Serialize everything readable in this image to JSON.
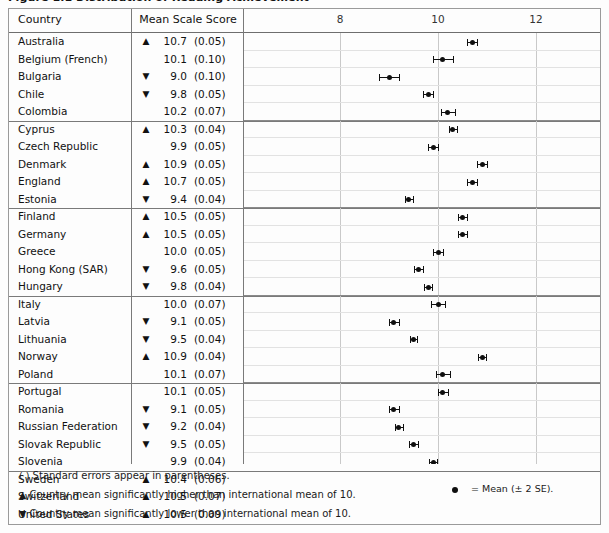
{
  "figure": {
    "clipped_title": "Figure 1.1 Distribution of Reading Achievement",
    "columns": {
      "country": "Country",
      "mean_scale_score": "Mean Scale Score"
    }
  },
  "axis": {
    "ticks": [
      8,
      10,
      12
    ],
    "tick_labels": [
      "8",
      "10",
      "12"
    ],
    "min": 6.4,
    "max": 13.6,
    "px_per_unit": 49.0,
    "origin_value": 8,
    "origin_px": 96
  },
  "footnotes": [
    {
      "symbol": "( )",
      "text": "Standard errors appear in parentheses."
    },
    {
      "symbol": "▲",
      "text": "Country mean significantly higher than international mean of 10."
    },
    {
      "symbol": "▼",
      "text": "Country mean significantly lower than international mean of 10."
    }
  ],
  "legend": {
    "marker": "dot",
    "text": "= Mean (± 2 SE)."
  },
  "chart_data": {
    "type": "scatter",
    "xlabel": "",
    "ylabel": "Country",
    "xlim": [
      6.4,
      13.6
    ],
    "xticks": [
      8,
      10,
      12
    ],
    "grid": true,
    "error_bars": "± 2 SE",
    "international_mean": 10,
    "categories": [
      "Australia",
      "Belgium (French)",
      "Bulgaria",
      "Chile",
      "Colombia",
      "Cyprus",
      "Czech Republic",
      "Denmark",
      "England",
      "Estonia",
      "Finland",
      "Germany",
      "Greece",
      "Hong Kong (SAR)",
      "Hungary",
      "Italy",
      "Latvia",
      "Lithuania",
      "Norway",
      "Poland",
      "Portugal",
      "Romania",
      "Russian Federation",
      "Slovak Republic",
      "Slovenia",
      "Sweden",
      "Switzerland",
      "United States"
    ],
    "rows": [
      {
        "country": "Australia",
        "marker": "▲",
        "mean": "10.7",
        "se": "(0.05)",
        "mean_value": 10.7,
        "se_value": 0.05,
        "group": 0
      },
      {
        "country": "Belgium (French)",
        "marker": "",
        "mean": "10.1",
        "se": "(0.10)",
        "mean_value": 10.1,
        "se_value": 0.1,
        "group": 0
      },
      {
        "country": "Bulgaria",
        "marker": "▼",
        "mean": "9.0",
        "se": "(0.10)",
        "mean_value": 9.0,
        "se_value": 0.1,
        "group": 0
      },
      {
        "country": "Chile",
        "marker": "▼",
        "mean": "9.8",
        "se": "(0.05)",
        "mean_value": 9.8,
        "se_value": 0.05,
        "group": 0
      },
      {
        "country": "Colombia",
        "marker": "",
        "mean": "10.2",
        "se": "(0.07)",
        "mean_value": 10.2,
        "se_value": 0.07,
        "group": 0
      },
      {
        "country": "Cyprus",
        "marker": "▲",
        "mean": "10.3",
        "se": "(0.04)",
        "mean_value": 10.3,
        "se_value": 0.04,
        "group": 1
      },
      {
        "country": "Czech Republic",
        "marker": "",
        "mean": "9.9",
        "se": "(0.05)",
        "mean_value": 9.9,
        "se_value": 0.05,
        "group": 1
      },
      {
        "country": "Denmark",
        "marker": "▲",
        "mean": "10.9",
        "se": "(0.05)",
        "mean_value": 10.9,
        "se_value": 0.05,
        "group": 1
      },
      {
        "country": "England",
        "marker": "▲",
        "mean": "10.7",
        "se": "(0.05)",
        "mean_value": 10.7,
        "se_value": 0.05,
        "group": 1
      },
      {
        "country": "Estonia",
        "marker": "▼",
        "mean": "9.4",
        "se": "(0.04)",
        "mean_value": 9.4,
        "se_value": 0.04,
        "group": 1
      },
      {
        "country": "Finland",
        "marker": "▲",
        "mean": "10.5",
        "se": "(0.05)",
        "mean_value": 10.5,
        "se_value": 0.05,
        "group": 2
      },
      {
        "country": "Germany",
        "marker": "▲",
        "mean": "10.5",
        "se": "(0.05)",
        "mean_value": 10.5,
        "se_value": 0.05,
        "group": 2
      },
      {
        "country": "Greece",
        "marker": "",
        "mean": "10.0",
        "se": "(0.05)",
        "mean_value": 10.0,
        "se_value": 0.05,
        "group": 2
      },
      {
        "country": "Hong Kong (SAR)",
        "marker": "▼",
        "mean": "9.6",
        "se": "(0.05)",
        "mean_value": 9.6,
        "se_value": 0.05,
        "group": 2
      },
      {
        "country": "Hungary",
        "marker": "▼",
        "mean": "9.8",
        "se": "(0.04)",
        "mean_value": 9.8,
        "se_value": 0.04,
        "group": 2
      },
      {
        "country": "Italy",
        "marker": "",
        "mean": "10.0",
        "se": "(0.07)",
        "mean_value": 10.0,
        "se_value": 0.07,
        "group": 3
      },
      {
        "country": "Latvia",
        "marker": "▼",
        "mean": "9.1",
        "se": "(0.05)",
        "mean_value": 9.1,
        "se_value": 0.05,
        "group": 3
      },
      {
        "country": "Lithuania",
        "marker": "▼",
        "mean": "9.5",
        "se": "(0.04)",
        "mean_value": 9.5,
        "se_value": 0.04,
        "group": 3
      },
      {
        "country": "Norway",
        "marker": "▲",
        "mean": "10.9",
        "se": "(0.04)",
        "mean_value": 10.9,
        "se_value": 0.04,
        "group": 3
      },
      {
        "country": "Poland",
        "marker": "",
        "mean": "10.1",
        "se": "(0.07)",
        "mean_value": 10.1,
        "se_value": 0.07,
        "group": 3
      },
      {
        "country": "Portugal",
        "marker": "",
        "mean": "10.1",
        "se": "(0.05)",
        "mean_value": 10.1,
        "se_value": 0.05,
        "group": 4
      },
      {
        "country": "Romania",
        "marker": "▼",
        "mean": "9.1",
        "se": "(0.05)",
        "mean_value": 9.1,
        "se_value": 0.05,
        "group": 4
      },
      {
        "country": "Russian Federation",
        "marker": "▼",
        "mean": "9.2",
        "se": "(0.04)",
        "mean_value": 9.2,
        "se_value": 0.04,
        "group": 4
      },
      {
        "country": "Slovak Republic",
        "marker": "▼",
        "mean": "9.5",
        "se": "(0.05)",
        "mean_value": 9.5,
        "se_value": 0.05,
        "group": 4
      },
      {
        "country": "Slovenia",
        "marker": "",
        "mean": "9.9",
        "se": "(0.04)",
        "mean_value": 9.9,
        "se_value": 0.04,
        "group": 4
      },
      {
        "country": "Sweden",
        "marker": "▲",
        "mean": "10.4",
        "se": "(0.06)",
        "mean_value": 10.4,
        "se_value": 0.06,
        "group": 5
      },
      {
        "country": "Switzerland",
        "marker": "▲",
        "mean": "10.5",
        "se": "(0.07)",
        "mean_value": 10.5,
        "se_value": 0.07,
        "group": 5
      },
      {
        "country": "United States",
        "marker": "▲",
        "mean": "10.5",
        "se": "(0.09)",
        "mean_value": 10.5,
        "se_value": 0.09,
        "group": 5
      }
    ]
  }
}
